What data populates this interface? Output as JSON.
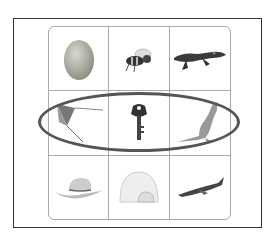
{
  "header": {
    "partial_text": ""
  },
  "grid": {
    "rows": [
      [
        {
          "name": "egg",
          "icon": "egg-icon"
        },
        {
          "name": "bee",
          "icon": "bee-icon"
        },
        {
          "name": "alligator",
          "icon": "alligator-icon"
        }
      ],
      [
        {
          "name": "kite",
          "icon": "kite-icon"
        },
        {
          "name": "key",
          "icon": "key-icon"
        },
        {
          "name": "kangaroo",
          "icon": "kangaroo-icon"
        }
      ],
      [
        {
          "name": "hat",
          "icon": "hat-icon"
        },
        {
          "name": "igloo",
          "icon": "igloo-icon"
        },
        {
          "name": "airplane",
          "icon": "airplane-icon"
        }
      ]
    ],
    "highlighted_row": 1
  },
  "colors": {
    "frame": "#333333",
    "grid": "#aaaaaa",
    "ellipse": "#555555"
  }
}
